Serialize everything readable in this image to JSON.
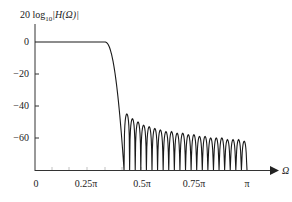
{
  "chart_data": {
    "type": "line",
    "title": "",
    "ylabel": "20 log10|H(Ω)|",
    "ylabel_parts": {
      "prefix": "20 log",
      "sub": "10",
      "suffix": "|H(Ω)|"
    },
    "xlabel": "Ω",
    "ylim": [
      -80,
      0
    ],
    "xlim": [
      0,
      3.1416
    ],
    "grid": false,
    "legend": "none",
    "x_ticks": [
      {
        "value": 0,
        "label": "0"
      },
      {
        "value": 0.7854,
        "label": "0.25π"
      },
      {
        "value": 1.5708,
        "label": "0.5π"
      },
      {
        "value": 2.3562,
        "label": "0.75π"
      },
      {
        "value": 3.1416,
        "label": "π"
      }
    ],
    "y_ticks": [
      {
        "value": 0,
        "label": "0"
      },
      {
        "value": -20,
        "label": "−20"
      },
      {
        "value": -40,
        "label": "−40"
      },
      {
        "value": -60,
        "label": "−60"
      }
    ],
    "series": [
      {
        "name": "magnitude response (dB)",
        "description": "Lowpass FIR magnitude response: flat 0 dB passband to ~0.33π, transition to ~-45 dB near 0.42π, then stopband ripple lobes decaying from about -45 dB to about -62 dB at π with deep nulls between lobes",
        "passband": {
          "from": 0,
          "to": 0.33,
          "level_db": 0
        },
        "transition": {
          "from_pi": 0.33,
          "to_pi": 0.42
        },
        "stopband_lobe_peaks_db": [
          -45,
          -48,
          -50,
          -52,
          -53,
          -54,
          -55,
          -56,
          -56,
          -57,
          -57,
          -58,
          -58,
          -59,
          -59,
          -60,
          -60,
          -60,
          -61,
          -61,
          -61,
          -62
        ],
        "stopband_start_pi": 0.42,
        "stopband_end_pi": 1.0
      }
    ],
    "colors": {
      "line": "#1a1a1a",
      "axis": "#333333",
      "text": "#222222"
    }
  }
}
